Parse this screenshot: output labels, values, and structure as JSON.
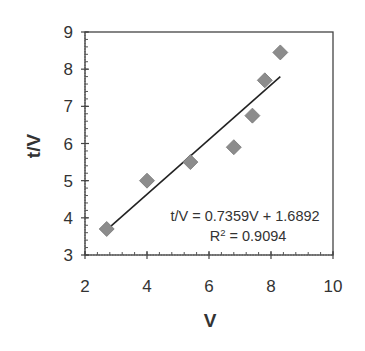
{
  "chart_data": {
    "type": "scatter",
    "title": "",
    "xlabel": "V",
    "ylabel": "t/V",
    "xlim": [
      2,
      10
    ],
    "ylim": [
      3,
      9
    ],
    "xticks": [
      2,
      4,
      6,
      8,
      10
    ],
    "yticks": [
      3,
      4,
      5,
      6,
      7,
      8,
      9
    ],
    "grid": false,
    "legend": null,
    "series": [
      {
        "name": "data",
        "marker": "diamond",
        "color": "#8c8c8c",
        "x": [
          2.7,
          4.0,
          5.4,
          6.8,
          7.4,
          7.8,
          8.3
        ],
        "y": [
          3.7,
          5.0,
          5.5,
          5.9,
          6.75,
          7.7,
          8.45
        ]
      }
    ],
    "trendline": {
      "type": "linear",
      "slope": 0.7359,
      "intercept": 1.6892,
      "x_range": [
        2.7,
        8.3
      ],
      "color": "#222222"
    },
    "annotations": [
      {
        "text": "t/V = 0.7359V + 1.6892"
      },
      {
        "text": "R² = 0.9094"
      }
    ]
  },
  "labels": {
    "xlabel": "V",
    "ylabel": "t/V",
    "equation": "t/V = 0.7359V + 1.6892",
    "r_squared_prefix": "R",
    "r_squared_sup": "2",
    "r_squared_value": " = 0.9094",
    "xticks": [
      "2",
      "4",
      "6",
      "8",
      "10"
    ],
    "yticks": [
      "3",
      "4",
      "5",
      "6",
      "7",
      "8",
      "9"
    ]
  }
}
